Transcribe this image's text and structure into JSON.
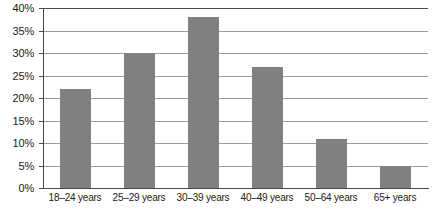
{
  "chart_data": {
    "type": "bar",
    "title": "",
    "subtitle": "",
    "xlabel": "",
    "ylabel": "",
    "categories": [
      "18–24 years",
      "25–29 years",
      "30–39 years",
      "40–49 years",
      "50–64 years",
      "65+ years"
    ],
    "values": [
      22,
      30,
      38,
      27,
      11,
      5
    ],
    "series": [
      {
        "name": "",
        "values": [
          22,
          30,
          38,
          27,
          11,
          5
        ]
      }
    ],
    "ylim": [
      0,
      40
    ],
    "y_tick_step": 5,
    "y_tick_labels": [
      "0%",
      "5%",
      "10%",
      "15%",
      "20%",
      "25%",
      "30%",
      "35%",
      "40%"
    ],
    "y_tick_values": [
      0,
      5,
      10,
      15,
      20,
      25,
      30,
      35,
      40
    ],
    "value_format": "percent",
    "grid": true,
    "grid_axis": "y",
    "legend": false,
    "legend_position": "none",
    "annotations": []
  },
  "style": {
    "bar_color": "#808080",
    "gridline_color": "#9b9b9b",
    "axis_color": "#4a4a4a",
    "background_color": "#ffffff",
    "text_color": "#1a1a1a"
  }
}
